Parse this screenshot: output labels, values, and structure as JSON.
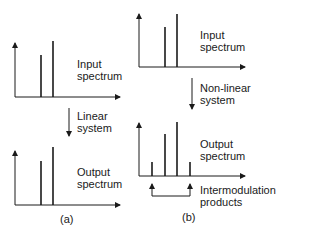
{
  "panel_a": {
    "input_label_1": "Input",
    "input_label_2": "spectrum",
    "system_label_1": "Linear",
    "system_label_2": "system",
    "output_label_1": "Output",
    "output_label_2": "spectrum",
    "caption": "(a)"
  },
  "panel_b": {
    "input_label_1": "Input",
    "input_label_2": "spectrum",
    "system_label_1": "Non-linear",
    "system_label_2": "system",
    "output_label_1": "Output",
    "output_label_2": "spectrum",
    "im_label_1": "Intermodulation",
    "im_label_2": "products",
    "caption": "(b)"
  },
  "colors": {
    "ink": "#1a1a1a",
    "background": "#ffffff"
  }
}
